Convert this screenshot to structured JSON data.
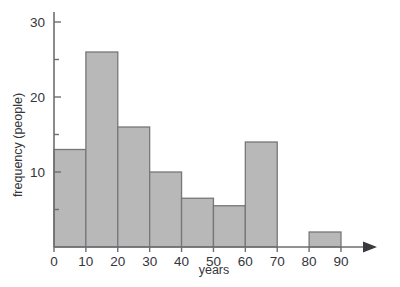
{
  "chart_data": {
    "type": "bar",
    "title": "",
    "subtitle": "",
    "xlabel": "years",
    "ylabel": "frequency (people)",
    "categories": [
      "0-10",
      "10-20",
      "20-30",
      "30-40",
      "40-50",
      "50-60",
      "60-70",
      "70-80",
      "80-90"
    ],
    "bin_edges": [
      0,
      10,
      20,
      30,
      40,
      50,
      60,
      70,
      80,
      90
    ],
    "values": [
      13,
      26,
      16,
      10,
      6.5,
      5.5,
      14,
      0,
      2
    ],
    "xlim": [
      0,
      90
    ],
    "ylim": [
      0,
      32
    ],
    "xticks": [
      0,
      10,
      20,
      30,
      40,
      50,
      60,
      70,
      80,
      90
    ],
    "xtick_labels": [
      "0",
      "10",
      "20",
      "30",
      "40",
      "50",
      "60",
      "70",
      "80",
      "90"
    ],
    "yticks": [
      5,
      10,
      15,
      20,
      25,
      30
    ],
    "ytick_labels": [
      "",
      "10",
      "",
      "20",
      "",
      "30"
    ],
    "ylabeled_ticks": [
      10,
      20,
      30
    ],
    "grid": false,
    "legend": false,
    "legend_position": "none",
    "bar_fill_color": "#b8b8b8",
    "bar_edge_color": "#77777b",
    "axis_color": "#6e6e72",
    "text_color": "#35353a",
    "x_axis_arrow": true,
    "annotations": []
  }
}
